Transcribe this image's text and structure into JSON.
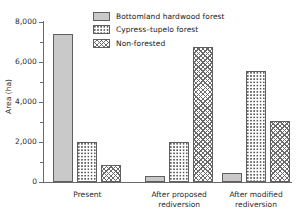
{
  "chart_data": {
    "type": "bar",
    "title": "",
    "xlabel": "",
    "ylabel": "Area (ha)",
    "ylim": [
      0,
      8000
    ],
    "grid": false,
    "legend_position": "top-center",
    "categories": [
      "Present",
      "After proposed rediversion",
      "After modified rediversion"
    ],
    "category_lines": [
      [
        "Present"
      ],
      [
        "After proposed",
        "rediversion"
      ],
      [
        "After modified",
        "rediversion"
      ]
    ],
    "y_ticks_major": [
      0,
      2000,
      4000,
      6000,
      8000
    ],
    "y_tick_labels": [
      "0",
      "2,000",
      "4,000",
      "6,000",
      "8,000"
    ],
    "y_ticks_minor": [
      1000,
      3000,
      5000,
      7000
    ],
    "series": [
      {
        "name": "Bottomland hardwood forest",
        "fill": "solid",
        "color": "#c9c9c9",
        "values": [
          7400,
          280,
          430
        ]
      },
      {
        "name": "Cypress–tupelo forest",
        "fill": "dots",
        "color": "#ffffff",
        "values": [
          2010,
          1990,
          5540
        ]
      },
      {
        "name": "Non-forested",
        "fill": "cross",
        "color": "#ffffff",
        "values": [
          840,
          6740,
          3050
        ]
      }
    ]
  },
  "legend": {
    "items": [
      {
        "label": "Bottomland hardwood forest",
        "fill": "solid"
      },
      {
        "label": "Cypress–tupelo forest",
        "fill": "dots"
      },
      {
        "label": "Non-forested",
        "fill": "cross"
      }
    ]
  },
  "axes": {
    "y_title": "Area (ha)"
  },
  "colors": {
    "axis": "#6a6a6a",
    "bar_outline": "#5f5f5f",
    "solid_fill": "#c9c9c9",
    "text": "#1a1a1a",
    "background": "#ffffff"
  }
}
